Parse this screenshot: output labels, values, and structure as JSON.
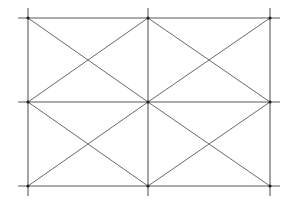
{
  "diagram": {
    "type": "grid-with-diagonals",
    "columns_x": [
      28,
      148,
      270
    ],
    "rows_y": [
      18,
      102,
      186
    ],
    "overshoot": 10,
    "line_color": "#5a5a5a",
    "diagonal_color": "#6a6a6a",
    "node_color": "#222222",
    "background": "#ffffff",
    "cells": [
      {
        "row": 0,
        "col": 0
      },
      {
        "row": 0,
        "col": 1
      },
      {
        "row": 1,
        "col": 0
      },
      {
        "row": 1,
        "col": 1
      }
    ]
  }
}
